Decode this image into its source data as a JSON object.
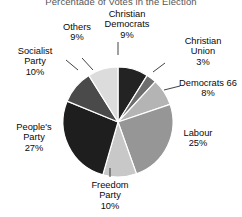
{
  "chart_data": {
    "type": "pie",
    "title": "Percentage of Votes in the Election",
    "xlabel": "",
    "ylabel": "",
    "legend": "none",
    "grid": false,
    "start_angle_deg": 90,
    "direction": "clockwise",
    "categories": [
      "Christian Democrats",
      "Christian Union",
      "Democrats 66",
      "Labour",
      "Freedom Party",
      "People's Party",
      "Socialist Party",
      "Others"
    ],
    "values": [
      9,
      3,
      8,
      25,
      10,
      27,
      10,
      9
    ],
    "value_labels": [
      "9%",
      "3%",
      "8%",
      "25%",
      "10%",
      "27%",
      "10%",
      "9%"
    ],
    "colors": [
      "#232323",
      "#6e6e6e",
      "#b4b4b4",
      "#969696",
      "#c8c8c8",
      "#1e1e1e",
      "#4a4a4a",
      "#dcdcdc"
    ],
    "slices": [
      {
        "name": "Christian Democrats",
        "value": 9,
        "label": "Christian Democrats",
        "pct": "9%",
        "color": "#232323"
      },
      {
        "name": "Christian Union",
        "value": 3,
        "label": "Christian Union",
        "pct": "3%",
        "color": "#6e6e6e"
      },
      {
        "name": "Democrats 66",
        "value": 8,
        "label": "Democrats 66",
        "pct": "8%",
        "color": "#b4b4b4"
      },
      {
        "name": "Labour",
        "value": 25,
        "label": "Labour",
        "pct": "25%",
        "color": "#969696"
      },
      {
        "name": "Freedom Party",
        "value": 10,
        "label": "Freedom Party",
        "pct": "10%",
        "color": "#c8c8c8"
      },
      {
        "name": "People's Party",
        "value": 27,
        "label": "People's Party",
        "pct": "27%",
        "color": "#1e1e1e"
      },
      {
        "name": "Socialist Party",
        "value": 10,
        "label": "Socialist Party",
        "pct": "10%",
        "color": "#4a4a4a"
      },
      {
        "name": "Others",
        "value": 9,
        "label": "Others",
        "pct": "9%",
        "color": "#dcdcdc"
      }
    ]
  },
  "labels": {
    "christian_democrats": {
      "line1": "Christian",
      "line2": "Democrats",
      "pct": "9%"
    },
    "christian_union": {
      "line1": "Christian",
      "line2": "Union",
      "pct": "3%"
    },
    "democrats66": {
      "line1": "Democrats 66",
      "pct": "8%"
    },
    "labour": {
      "line1": "Labour",
      "pct": "25%"
    },
    "freedom_party": {
      "line1": "Freedom",
      "line2": "Party",
      "pct": "10%"
    },
    "peoples_party": {
      "line1": "People's",
      "line2": "Party",
      "pct": "27%"
    },
    "socialist_party": {
      "line1": "Socialist",
      "line2": "Party",
      "pct": "10%"
    },
    "others": {
      "line1": "Others",
      "pct": "9%"
    }
  }
}
